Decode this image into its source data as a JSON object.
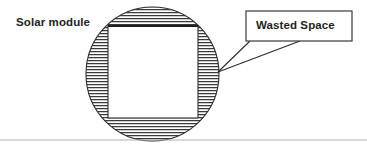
{
  "diagram": {
    "title_label": "Solar module",
    "callout": {
      "text": "Wasted Space",
      "box": {
        "x": 246,
        "y": 11,
        "width": 106,
        "height": 30
      },
      "tail_points": [
        {
          "x": 250,
          "y": 41
        },
        {
          "x": 300,
          "y": 41
        }
      ],
      "anchor": {
        "x": 218,
        "y": 72
      }
    },
    "wafer_circle": {
      "name": "silicon-wafer-circle",
      "cx": 152.5,
      "cy": 74,
      "rx": 66.5,
      "ry": 67,
      "hatch": "horizontal-lines",
      "hatch_spacing_px": 3
    },
    "cell_square": {
      "name": "solar-cell-square",
      "x": 108,
      "y": 26,
      "width": 90,
      "height": 92,
      "fill": "#ffffff"
    },
    "baseline_rule": {
      "y": 140,
      "x1": 0,
      "x2": 367
    },
    "colors": {
      "stroke": "#2b2b2b",
      "hatch": "#3a3a3a",
      "text": "#242424",
      "rule": "#b4b4b4",
      "background": "#ffffff"
    }
  }
}
